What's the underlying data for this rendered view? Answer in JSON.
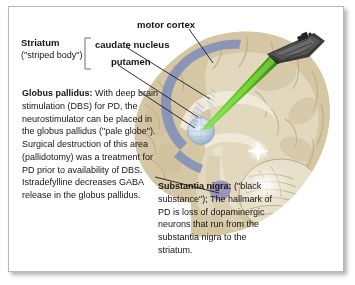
{
  "figure": {
    "border_color": "#b9b9b9",
    "background": "#ffffff"
  },
  "labels": {
    "motor_cortex": "motor cortex",
    "caudate_nucleus": "caudate nucleus",
    "putamen": "putamen",
    "striatum_name": "Striatum",
    "striatum_subtitle": "(\"striped body\")"
  },
  "blocks": {
    "globus_pallidus": {
      "title": "Globus pallidus:",
      "body": " With deep brain stimulation (DBS) for PD, the neurostimulator can be placed in the globus pallidus (\"pale globe\"). Surgical destruction of this area (pallidotomy) was a treatment for PD prior to availability of DBS. Istradefylline decreases GABA release in the globus pallidus."
    },
    "substantia_nigra": {
      "title": "Substantia nigra:",
      "body": " (\"black substance\"); The hallmark of PD is loss of dopaminergic neurons that run from the substantia nigra to the striatum."
    }
  },
  "illustration": {
    "brain_fill": "#d9cdad",
    "brain_fill_light": "#e6ddc4",
    "brain_inner": "#cfc2a1",
    "brain_pale": "#eae4d2",
    "striatum_band_color": "#8390ba",
    "globus_pallidus_color": "#c5d4e2",
    "substantia_nigra_color": "#9a93bc",
    "laser_color": "#5bbf1d",
    "ship_color": "#2e2e2e",
    "sparkle_color": "#ffffff",
    "leader_line_color": "#1a1a1a",
    "bracket_color": "#6b6b8a",
    "items": [
      "sagittal-brain-section",
      "cerebral-cortex",
      "corpus-callosum",
      "cerebellum",
      "brainstem",
      "striatum-band",
      "caudate-head",
      "putamen-hatch",
      "globus-pallidus-sphere",
      "substantia-nigra-patch",
      "star-destroyer-ship",
      "green-laser-beam",
      "white-sparkle"
    ]
  }
}
